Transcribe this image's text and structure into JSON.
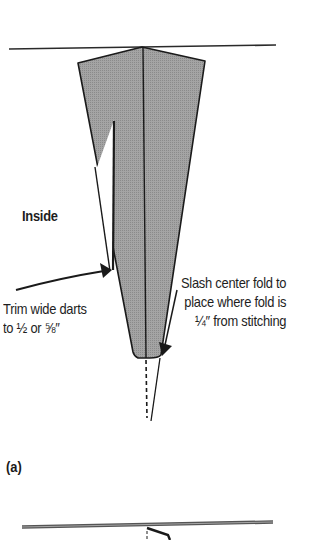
{
  "figure": {
    "part_label": "(a)",
    "labels": {
      "inside": "Inside",
      "trim": {
        "line1": "Trim wide darts",
        "line2": "to ½ or ⅝″"
      },
      "slash": {
        "line1": "Slash center fold to",
        "line2": "place where fold is",
        "line3": "¼″ from stitching"
      }
    },
    "colors": {
      "fabric_fill": "#9c9c9c",
      "outline": "#1a1a1a",
      "background": "#ffffff"
    }
  }
}
